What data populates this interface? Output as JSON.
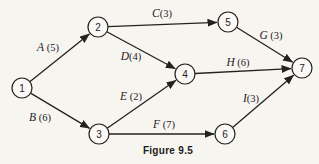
{
  "figure": {
    "caption": "Figure 9.5",
    "background": "#f7f5f0",
    "ink": "#24221f"
  },
  "diagram": {
    "type": "directed-graph",
    "node_radius": 10,
    "nodes": [
      {
        "id": "1",
        "x": 22,
        "y": 88
      },
      {
        "id": "2",
        "x": 98,
        "y": 27
      },
      {
        "id": "3",
        "x": 99,
        "y": 134
      },
      {
        "id": "4",
        "x": 185,
        "y": 74
      },
      {
        "id": "5",
        "x": 228,
        "y": 22
      },
      {
        "id": "6",
        "x": 225,
        "y": 134
      },
      {
        "id": "7",
        "x": 302,
        "y": 68
      }
    ],
    "edges": [
      {
        "name": "A",
        "label": "A (5)",
        "weight": 5,
        "from": "1",
        "to": "2",
        "label_x": 48,
        "label_y": 51
      },
      {
        "name": "B",
        "label": "B (6)",
        "weight": 6,
        "from": "1",
        "to": "3",
        "label_x": 40,
        "label_y": 121
      },
      {
        "name": "C",
        "label": "C(3)",
        "weight": 3,
        "from": "2",
        "to": "5",
        "label_x": 162,
        "label_y": 17
      },
      {
        "name": "D",
        "label": "D(4)",
        "weight": 4,
        "from": "2",
        "to": "4",
        "label_x": 131,
        "label_y": 60
      },
      {
        "name": "E",
        "label": "E (2)",
        "weight": 2,
        "from": "3",
        "to": "4",
        "label_x": 131,
        "label_y": 100
      },
      {
        "name": "F",
        "label": "F (7)",
        "weight": 7,
        "from": "3",
        "to": "6",
        "label_x": 164,
        "label_y": 128
      },
      {
        "name": "G",
        "label": "G (3)",
        "weight": 3,
        "from": "5",
        "to": "7",
        "label_x": 271,
        "label_y": 39
      },
      {
        "name": "H",
        "label": "H (6)",
        "weight": 6,
        "from": "4",
        "to": "7",
        "label_x": 238,
        "label_y": 66
      },
      {
        "name": "I",
        "label": "I(3)",
        "weight": 3,
        "from": "6",
        "to": "7",
        "label_x": 251,
        "label_y": 102
      }
    ]
  }
}
